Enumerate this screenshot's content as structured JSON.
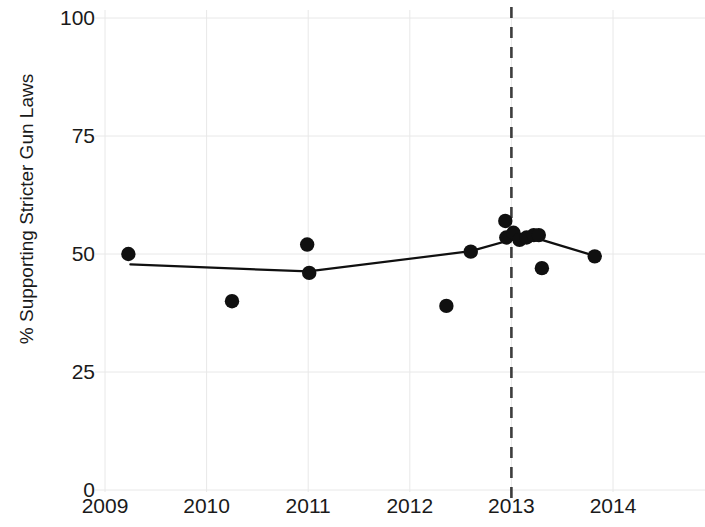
{
  "chart_data": {
    "type": "scatter",
    "title": "",
    "xlabel": "",
    "ylabel": "% Supporting Stricter Gun Laws",
    "xlim": [
      2009,
      2014.12
    ],
    "ylim": [
      0,
      103
    ],
    "grid": true,
    "legend": false,
    "x_ticks": [
      "2009",
      "2010",
      "2011",
      "2012",
      "2013",
      "2014"
    ],
    "x_tick_values": [
      2009,
      2010,
      2011,
      2012,
      2013,
      2014
    ],
    "y_ticks": [
      "0",
      "25",
      "50",
      "75",
      "100"
    ],
    "y_tick_values": [
      0,
      25,
      50,
      75,
      100
    ],
    "series": [
      {
        "name": "Poll results",
        "type": "scatter",
        "marker": "filled-circle",
        "color": "#101010",
        "points": [
          {
            "x": 2009.23,
            "y": 50.0
          },
          {
            "x": 2010.25,
            "y": 40.0
          },
          {
            "x": 2010.99,
            "y": 52.0
          },
          {
            "x": 2011.01,
            "y": 46.0
          },
          {
            "x": 2012.36,
            "y": 39.0
          },
          {
            "x": 2012.6,
            "y": 50.5
          },
          {
            "x": 2012.94,
            "y": 57.0
          },
          {
            "x": 2012.95,
            "y": 53.5
          },
          {
            "x": 2013.02,
            "y": 54.5
          },
          {
            "x": 2013.08,
            "y": 53.0
          },
          {
            "x": 2013.15,
            "y": 53.5
          },
          {
            "x": 2013.22,
            "y": 54.0
          },
          {
            "x": 2013.27,
            "y": 54.0
          },
          {
            "x": 2013.3,
            "y": 47.0
          },
          {
            "x": 2013.82,
            "y": 49.5
          }
        ]
      },
      {
        "name": "Trend line",
        "type": "line",
        "color": "#101010",
        "points": [
          {
            "x": 2009.25,
            "y": 47.8
          },
          {
            "x": 2011.0,
            "y": 46.3
          },
          {
            "x": 2012.6,
            "y": 50.6
          },
          {
            "x": 2013.0,
            "y": 53.0
          },
          {
            "x": 2013.25,
            "y": 53.3
          },
          {
            "x": 2013.82,
            "y": 49.6
          }
        ]
      }
    ],
    "annotations": [
      {
        "type": "vertical-dashed-line",
        "x": 2013.0,
        "color": "#3d3d3d",
        "label": ""
      }
    ],
    "colors": {
      "background": "#ffffff",
      "gridline": "#e8e8e8",
      "axis_text": "#1a1a1a",
      "marker": "#101010",
      "trend_line": "#101010",
      "event_line": "#3d3d3d"
    }
  }
}
